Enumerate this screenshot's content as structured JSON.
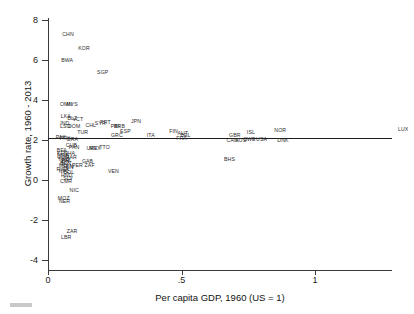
{
  "chart_data": {
    "type": "scatter",
    "title": "",
    "xlabel": "Per capita GDP, 1960 (US = 1)",
    "ylabel": "Growth rate, 1960 - 2013",
    "xlim": [
      0,
      1.5
    ],
    "ylim": [
      -4,
      8
    ],
    "xticks": [
      0,
      0.5,
      1,
      1.5
    ],
    "xtick_labels": [
      "0",
      ".5",
      "1",
      "1.5"
    ],
    "yticks": [
      8,
      6,
      4,
      2,
      0,
      -2,
      -4
    ],
    "ytick_labels": [
      "8",
      "6",
      "4",
      "2",
      "0",
      "-2",
      "-4"
    ],
    "grid": false,
    "legend": false,
    "marker_style": "text-label",
    "reference_lines": [
      {
        "orientation": "horizontal",
        "y": 2.1,
        "label": ""
      }
    ],
    "points": [
      {
        "label": "CHN",
        "x": 0.075,
        "y": 7.25
      },
      {
        "label": "KOR",
        "x": 0.135,
        "y": 6.55
      },
      {
        "label": "BWA",
        "x": 0.072,
        "y": 5.95
      },
      {
        "label": "SGP",
        "x": 0.205,
        "y": 5.35
      },
      {
        "label": "OMN",
        "x": 0.068,
        "y": 3.75
      },
      {
        "label": "MYS",
        "x": 0.09,
        "y": 3.75
      },
      {
        "label": "LKA",
        "x": 0.067,
        "y": 3.15
      },
      {
        "label": "BLZ",
        "x": 0.091,
        "y": 3.05
      },
      {
        "label": "VCT",
        "x": 0.112,
        "y": 2.98
      },
      {
        "label": "IND",
        "x": 0.063,
        "y": 2.82
      },
      {
        "label": "LSO",
        "x": 0.065,
        "y": 2.66
      },
      {
        "label": "DOM",
        "x": 0.098,
        "y": 2.66
      },
      {
        "label": "CHL",
        "x": 0.16,
        "y": 2.68
      },
      {
        "label": "SYR",
        "x": 0.196,
        "y": 2.8
      },
      {
        "label": "PRT",
        "x": 0.215,
        "y": 2.85
      },
      {
        "label": "PRI",
        "x": 0.252,
        "y": 2.66
      },
      {
        "label": "BRB",
        "x": 0.268,
        "y": 2.66
      },
      {
        "label": "JPN",
        "x": 0.33,
        "y": 2.88
      },
      {
        "label": "ESP",
        "x": 0.29,
        "y": 2.38
      },
      {
        "label": "TUR",
        "x": 0.13,
        "y": 2.34
      },
      {
        "label": "GRC",
        "x": 0.258,
        "y": 2.18
      },
      {
        "label": "ITA",
        "x": 0.385,
        "y": 2.2
      },
      {
        "label": "FIN",
        "x": 0.47,
        "y": 2.38
      },
      {
        "label": "AUT",
        "x": 0.505,
        "y": 2.3
      },
      {
        "label": "BEL",
        "x": 0.515,
        "y": 2.18
      },
      {
        "label": "FRA",
        "x": 0.5,
        "y": 2.05
      },
      {
        "label": "PAK",
        "x": 0.048,
        "y": 2.1
      },
      {
        "label": "PRY",
        "x": 0.064,
        "y": 2.05
      },
      {
        "label": "BRA",
        "x": 0.092,
        "y": 2.0
      },
      {
        "label": "GBR",
        "x": 0.7,
        "y": 2.22
      },
      {
        "label": "NOR",
        "x": 0.87,
        "y": 2.45
      },
      {
        "label": "ISL",
        "x": 0.76,
        "y": 2.35
      },
      {
        "label": "CAN",
        "x": 0.69,
        "y": 1.95
      },
      {
        "label": "AUS",
        "x": 0.722,
        "y": 1.95
      },
      {
        "label": "SWE",
        "x": 0.755,
        "y": 1.98
      },
      {
        "label": "USA",
        "x": 0.8,
        "y": 1.98
      },
      {
        "label": "DNK",
        "x": 0.88,
        "y": 1.95
      },
      {
        "label": "LUX",
        "x": 1.33,
        "y": 2.52
      },
      {
        "label": "CUB",
        "x": 0.088,
        "y": 1.72
      },
      {
        "label": "PAN",
        "x": 0.098,
        "y": 1.62
      },
      {
        "label": "URY",
        "x": 0.165,
        "y": 1.55
      },
      {
        "label": "MEX",
        "x": 0.176,
        "y": 1.55
      },
      {
        "label": "TTO",
        "x": 0.212,
        "y": 1.58
      },
      {
        "label": "BHS",
        "x": 0.68,
        "y": 1.02
      },
      {
        "label": "PER",
        "x": 0.11,
        "y": 0.68
      },
      {
        "label": "GAB",
        "x": 0.148,
        "y": 0.9
      },
      {
        "label": "ZAF",
        "x": 0.156,
        "y": 0.72
      },
      {
        "label": "VEN",
        "x": 0.245,
        "y": 0.4
      },
      {
        "label": "BFA",
        "x": 0.052,
        "y": 1.45
      },
      {
        "label": "KEN",
        "x": 0.054,
        "y": 1.28
      },
      {
        "label": "NGA",
        "x": 0.056,
        "y": 1.22
      },
      {
        "label": "GHA",
        "x": 0.08,
        "y": 1.3
      },
      {
        "label": "COG",
        "x": 0.057,
        "y": 1.1
      },
      {
        "label": "TGO",
        "x": 0.059,
        "y": 1.0
      },
      {
        "label": "MAR",
        "x": 0.086,
        "y": 1.08
      },
      {
        "label": "PHL",
        "x": 0.07,
        "y": 0.95
      },
      {
        "label": "IDN",
        "x": 0.063,
        "y": 0.88
      },
      {
        "label": "BEN",
        "x": 0.066,
        "y": 0.8
      },
      {
        "label": "MLI",
        "x": 0.058,
        "y": 0.72
      },
      {
        "label": "SEN",
        "x": 0.074,
        "y": 0.64
      },
      {
        "label": "CIV",
        "x": 0.082,
        "y": 0.58
      },
      {
        "label": "RWA",
        "x": 0.055,
        "y": 0.5
      },
      {
        "label": "NPL",
        "x": 0.06,
        "y": 0.42
      },
      {
        "label": "BOL",
        "x": 0.078,
        "y": 0.36
      },
      {
        "label": "HND",
        "x": 0.07,
        "y": 0.18
      },
      {
        "label": "SLV",
        "x": 0.075,
        "y": 0.05
      },
      {
        "label": "CMR",
        "x": 0.068,
        "y": -0.1
      },
      {
        "label": "NIC",
        "x": 0.098,
        "y": -0.55
      },
      {
        "label": "MOZ",
        "x": 0.059,
        "y": -0.95
      },
      {
        "label": "NER",
        "x": 0.062,
        "y": -1.08
      },
      {
        "label": "ZAR",
        "x": 0.09,
        "y": -2.62
      },
      {
        "label": "LBR",
        "x": 0.068,
        "y": -2.9
      }
    ]
  },
  "axes": {
    "x_title": "Per capita GDP, 1960 (US = 1)",
    "y_title": "Growth rate, 1960 - 2013"
  }
}
